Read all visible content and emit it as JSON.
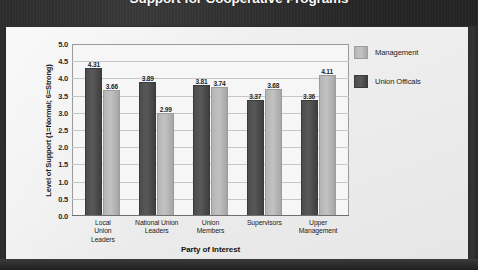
{
  "header": {
    "title": "Support for Cooperative Programs"
  },
  "legend": {
    "position": "right",
    "items": [
      {
        "label": "Management",
        "color": "#b6b6b6",
        "swatch_name": "legend-swatch-management"
      },
      {
        "label": "Union Officals",
        "color": "#4d4d4d",
        "swatch_name": "legend-swatch-union-officals"
      }
    ]
  },
  "axes": {
    "ylabel": "Level of Support (1=Normal; 6=Strong)",
    "xlabel": "Party of Interest",
    "yticks": [
      "5.0",
      "4.5",
      "4.0",
      "3.5",
      "3.0",
      "2.5",
      "2.0",
      "1.5",
      "1.0",
      "0.5",
      "0.0"
    ]
  },
  "chart_data": {
    "type": "bar",
    "title": "Support for Cooperative Programs",
    "xlabel": "Party of Interest",
    "ylabel": "Level of Support (1=Normal; 6=Strong)",
    "ylim": [
      0.0,
      5.0
    ],
    "ytick_step": 0.5,
    "grid": true,
    "legend_position": "right",
    "categories": [
      "Local Union Leaders",
      "National Union Leaders",
      "Union Members",
      "Supervisors",
      "Upper Management"
    ],
    "category_lines": [
      [
        "Local",
        "Union",
        "Leaders"
      ],
      [
        "National Union",
        "Leaders"
      ],
      [
        "Union",
        "Members"
      ],
      [
        "Supervisors"
      ],
      [
        "Upper",
        "Management"
      ]
    ],
    "series": [
      {
        "name": "Union Officals",
        "color": "#4d4d4d",
        "values": [
          4.31,
          3.89,
          3.81,
          3.37,
          3.36
        ],
        "labels": [
          "4.31",
          "3.89",
          "3.81",
          "3.37",
          "3.36"
        ]
      },
      {
        "name": "Management",
        "color": "#b6b6b6",
        "values": [
          3.66,
          2.99,
          3.74,
          3.68,
          4.11
        ],
        "labels": [
          "3.66",
          "2.99",
          "3.74",
          "3.68",
          "4.11"
        ]
      }
    ]
  },
  "colors": {
    "banner": "#272727",
    "card": "#eeeeee",
    "plot_background": "#f6f6f6",
    "gridline": "#c6c6c6",
    "dark_bar": "#4d4d4d",
    "light_bar": "#b6b6b6"
  }
}
